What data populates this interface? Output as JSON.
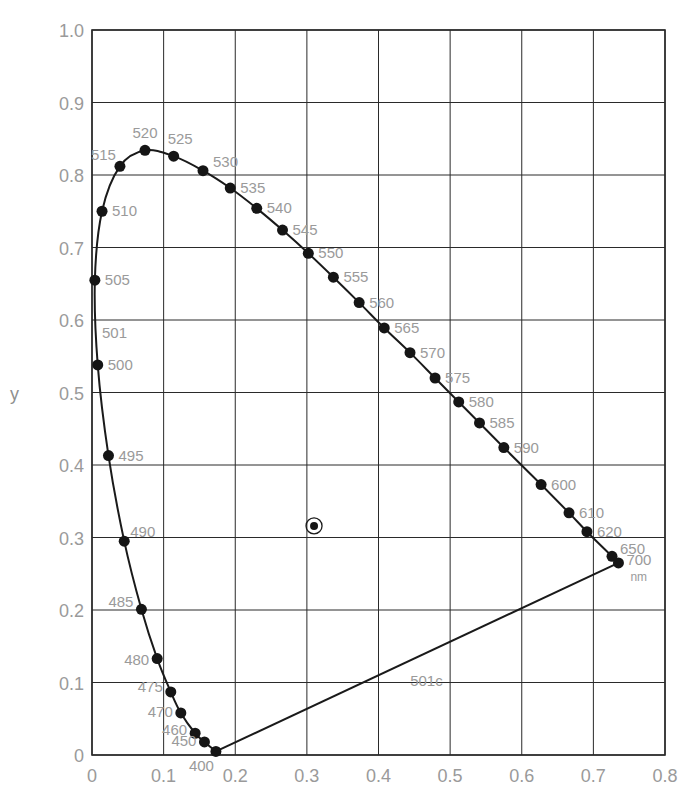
{
  "chart_data": {
    "type": "scatter",
    "title": "",
    "xlabel": "",
    "ylabel": "y",
    "xlim": [
      0,
      0.8
    ],
    "ylim": [
      0,
      1.0
    ],
    "grid": true,
    "x_ticks": [
      "0",
      "0.1",
      "0.2",
      "0.3",
      "0.4",
      "0.5",
      "0.6",
      "0.7",
      "0.8"
    ],
    "y_ticks": [
      "0",
      "0.1",
      "0.2",
      "0.3",
      "0.4",
      "0.5",
      "0.6",
      "0.7",
      "0.8",
      "0.9",
      "1.0"
    ],
    "unit_label": "nm",
    "series": [
      {
        "name": "spectral locus",
        "points": [
          {
            "label": "400",
            "x": 0.173,
            "y": 0.005
          },
          {
            "label": "450",
            "x": 0.157,
            "y": 0.018
          },
          {
            "label": "460",
            "x": 0.144,
            "y": 0.03
          },
          {
            "label": "470",
            "x": 0.124,
            "y": 0.058
          },
          {
            "label": "475",
            "x": 0.11,
            "y": 0.087
          },
          {
            "label": "480",
            "x": 0.091,
            "y": 0.133
          },
          {
            "label": "485",
            "x": 0.069,
            "y": 0.201
          },
          {
            "label": "490",
            "x": 0.045,
            "y": 0.295
          },
          {
            "label": "495",
            "x": 0.023,
            "y": 0.413
          },
          {
            "label": "500",
            "x": 0.008,
            "y": 0.538
          },
          {
            "label": "505",
            "x": 0.004,
            "y": 0.655
          },
          {
            "label": "510",
            "x": 0.014,
            "y": 0.75
          },
          {
            "label": "515",
            "x": 0.039,
            "y": 0.812
          },
          {
            "label": "520",
            "x": 0.074,
            "y": 0.834
          },
          {
            "label": "525",
            "x": 0.114,
            "y": 0.826
          },
          {
            "label": "530",
            "x": 0.155,
            "y": 0.806
          },
          {
            "label": "535",
            "x": 0.193,
            "y": 0.782
          },
          {
            "label": "540",
            "x": 0.23,
            "y": 0.754
          },
          {
            "label": "545",
            "x": 0.266,
            "y": 0.724
          },
          {
            "label": "550",
            "x": 0.302,
            "y": 0.692
          },
          {
            "label": "555",
            "x": 0.337,
            "y": 0.659
          },
          {
            "label": "560",
            "x": 0.373,
            "y": 0.624
          },
          {
            "label": "565",
            "x": 0.408,
            "y": 0.589
          },
          {
            "label": "570",
            "x": 0.444,
            "y": 0.555
          },
          {
            "label": "575",
            "x": 0.479,
            "y": 0.52
          },
          {
            "label": "580",
            "x": 0.512,
            "y": 0.487
          },
          {
            "label": "585",
            "x": 0.541,
            "y": 0.458
          },
          {
            "label": "590",
            "x": 0.575,
            "y": 0.424
          },
          {
            "label": "600",
            "x": 0.627,
            "y": 0.373
          },
          {
            "label": "610",
            "x": 0.666,
            "y": 0.334
          },
          {
            "label": "620",
            "x": 0.691,
            "y": 0.308
          },
          {
            "label": "650",
            "x": 0.726,
            "y": 0.274
          },
          {
            "label": "700",
            "x": 0.735,
            "y": 0.265
          }
        ]
      },
      {
        "name": "white point",
        "points": [
          {
            "label": "",
            "x": 0.31,
            "y": 0.316
          }
        ]
      }
    ],
    "annotations": [
      {
        "text": "501",
        "x": 0.014,
        "y": 0.575
      },
      {
        "text": "501c",
        "x": 0.5,
        "y": 0.12
      }
    ],
    "purple_line": {
      "from": [
        0.173,
        0.005
      ],
      "to": [
        0.735,
        0.265
      ]
    }
  }
}
